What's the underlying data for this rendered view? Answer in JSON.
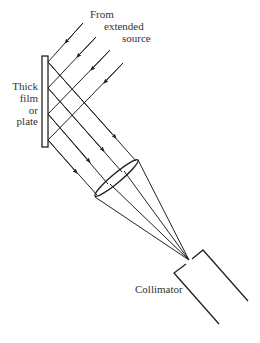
{
  "labels": {
    "source_line1": "From",
    "source_line2": "extended",
    "source_line3": "source",
    "plate_line1": "Thick",
    "plate_line2": "film",
    "plate_line3": "or",
    "plate_line4": "plate",
    "collimator": "Collimator"
  },
  "colors": {
    "ink": "#222222",
    "background": "#ffffff"
  },
  "diagram": {
    "components": [
      "extended-source",
      "thick-film-or-plate",
      "converging-lens",
      "collimator"
    ],
    "incoming_rays": 4,
    "reflected_rays": 4
  }
}
